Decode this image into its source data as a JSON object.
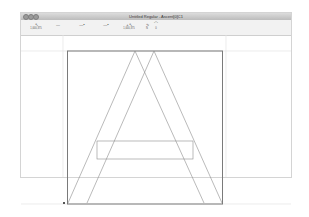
{
  "window": {
    "title": "Untitled Regular - Ascent[0]C1",
    "traffic_lights": [
      "close",
      "minimize",
      "zoom"
    ]
  },
  "toolbar": {
    "tools": [
      {
        "name": "pointer-tool",
        "icon": "↖",
        "label": "1,000,375"
      },
      {
        "name": "line-tool",
        "icon": "—",
        "label": ""
      },
      {
        "name": "line-node-tool",
        "icon": "—•",
        "label": ""
      },
      {
        "name": "line-node-2-tool",
        "icon": "—•",
        "label": ""
      },
      {
        "name": "coordinates-tool",
        "icon": "+↖",
        "label": "1,000,375"
      },
      {
        "name": "curve-tool",
        "icon": "∿",
        "label": "N"
      },
      {
        "name": "curve-tool-2",
        "icon": "⌒",
        "label": "0"
      }
    ]
  },
  "canvas": {
    "glyph": "A",
    "stroke_color": "#888888",
    "box_color": "#777777",
    "guide_color": "#e2e2e2"
  }
}
